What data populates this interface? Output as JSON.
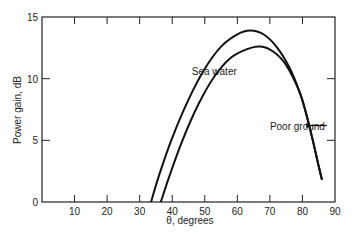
{
  "chart_data": {
    "type": "line",
    "title": "",
    "xlabel": "θ, degrees",
    "ylabel": "Power gain, dB",
    "xlim": [
      0,
      90
    ],
    "ylim": [
      0,
      15
    ],
    "xticks": [
      10,
      20,
      30,
      40,
      50,
      60,
      70,
      80,
      90
    ],
    "yticks": [
      0,
      5,
      10,
      15
    ],
    "grid": false,
    "legend": "inline annotations",
    "series": [
      {
        "name": "Sea water",
        "x": [
          33.5,
          36,
          40,
          45,
          50,
          55,
          60,
          64,
          68,
          72,
          76,
          79,
          81,
          83,
          85,
          86
        ],
        "values": [
          0,
          2.2,
          5.2,
          8.3,
          10.8,
          12.6,
          13.6,
          13.9,
          13.6,
          12.6,
          10.9,
          9.0,
          7.3,
          5.2,
          2.9,
          1.8
        ]
      },
      {
        "name": "Poor ground",
        "x": [
          36.5,
          39,
          43,
          48,
          53,
          58,
          63,
          67,
          71,
          75,
          79,
          81,
          83,
          85,
          86
        ],
        "values": [
          0,
          2.0,
          4.9,
          7.9,
          10.2,
          11.7,
          12.4,
          12.6,
          12.2,
          11.1,
          9.0,
          7.3,
          5.2,
          2.9,
          1.8
        ]
      }
    ],
    "annotations": [
      {
        "text": "Sea water",
        "x": 46,
        "y": 10.6
      },
      {
        "text": "Poor ground",
        "x": 70,
        "y": 6.2,
        "arrow_to": [
          83,
          6.2
        ]
      }
    ]
  }
}
